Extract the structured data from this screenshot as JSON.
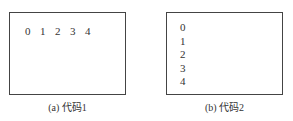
{
  "panels": [
    {
      "id": "a",
      "caption": "(a) 代码1",
      "layout": "horizontal",
      "values": [
        "0",
        "1",
        "2",
        "3",
        "4"
      ]
    },
    {
      "id": "b",
      "caption": "(b) 代码2",
      "layout": "vertical",
      "values": [
        "0",
        "1",
        "2",
        "3",
        "4"
      ]
    }
  ]
}
